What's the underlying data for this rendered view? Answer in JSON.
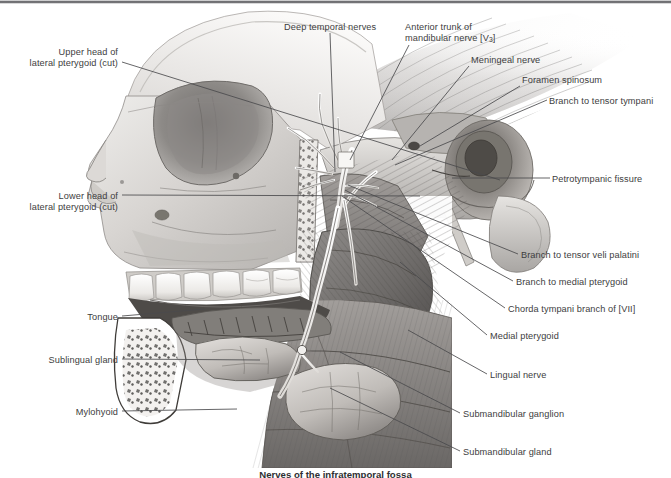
{
  "figure": {
    "title": "Nerves of the infratemporal fossa",
    "caption": "Nerves of the infratemporal fossa",
    "medium": "grayscale anatomical illustration",
    "background_color": "#ffffff",
    "ink_color": "#3d3d40",
    "leader_line_color": "#4a4a4d",
    "tone_light": "#e7e5e4",
    "tone_mid": "#b9b7b6",
    "tone_dark": "#6e6c6c",
    "tone_deep": "#3a3938"
  },
  "labels": [
    {
      "id": "upper-head-lateral-pterygoid",
      "text_line1": "Upper head of",
      "text_line2": "lateral pterygoid (cut)",
      "align": "right",
      "x": 14,
      "y": 47,
      "width": 104
    },
    {
      "id": "lower-head-lateral-pterygoid",
      "text_line1": "Lower head of",
      "text_line2": "lateral pterygoid (cut)",
      "align": "right",
      "x": 14,
      "y": 191,
      "width": 104
    },
    {
      "id": "tongue",
      "text_line1": "Tongue",
      "text_line2": "",
      "align": "right",
      "x": 40,
      "y": 312,
      "width": 78
    },
    {
      "id": "sublingual-gland",
      "text_line1": "Sublingual gland",
      "text_line2": "",
      "align": "right",
      "x": 20,
      "y": 355,
      "width": 98
    },
    {
      "id": "mylohyoid",
      "text_line1": "Mylohyoid",
      "text_line2": "",
      "align": "right",
      "x": 33,
      "y": 407,
      "width": 85
    },
    {
      "id": "deep-temporal-nerves",
      "text_line1": "Deep temporal nerves",
      "text_line2": "",
      "align": "left",
      "x": 284,
      "y": 22,
      "width": 118
    },
    {
      "id": "anterior-trunk-mandibular-nerve",
      "text_line1": "Anterior trunk of",
      "text_line2": "mandibular nerve [V3]",
      "align": "left",
      "x": 405,
      "y": 22,
      "width": 125
    },
    {
      "id": "meningeal-nerve",
      "text_line1": "Meningeal nerve",
      "text_line2": "",
      "align": "left",
      "x": 471,
      "y": 55,
      "width": 96
    },
    {
      "id": "foramen-spinosum",
      "text_line1": "Foramen spinosum",
      "text_line2": "",
      "align": "left",
      "x": 522,
      "y": 75,
      "width": 104
    },
    {
      "id": "branch-to-tensor-tympani",
      "text_line1": "Branch to tensor tympani",
      "text_line2": "",
      "align": "left",
      "x": 549,
      "y": 96,
      "width": 122
    },
    {
      "id": "petrotympanic-fissure",
      "text_line1": "Petrotympanic fissure",
      "text_line2": "",
      "align": "left",
      "x": 552,
      "y": 174,
      "width": 119
    },
    {
      "id": "branch-to-tensor-veli-palatini",
      "text_line1": "Branch to tensor veli palatini",
      "text_line2": "",
      "align": "left",
      "x": 521,
      "y": 250,
      "width": 150
    },
    {
      "id": "branch-to-medial-pterygoid",
      "text_line1": "Branch to medial pterygoid",
      "text_line2": "",
      "align": "left",
      "x": 516,
      "y": 277,
      "width": 155
    },
    {
      "id": "chorda-tympani-branch-of-vii",
      "text_line1": "Chorda tympani branch of [VII]",
      "text_line2": "",
      "align": "left",
      "x": 508,
      "y": 304,
      "width": 163
    },
    {
      "id": "medial-pterygoid",
      "text_line1": "Medial pterygoid",
      "text_line2": "",
      "align": "left",
      "x": 490,
      "y": 331,
      "width": 110
    },
    {
      "id": "lingual-nerve",
      "text_line1": "Lingual nerve",
      "text_line2": "",
      "align": "left",
      "x": 490,
      "y": 370,
      "width": 100
    },
    {
      "id": "submandibular-ganglion",
      "text_line1": "Submandibular ganglion",
      "text_line2": "",
      "align": "left",
      "x": 463,
      "y": 409,
      "width": 134
    },
    {
      "id": "submandibular-gland",
      "text_line1": "Submandibular gland",
      "text_line2": "",
      "align": "left",
      "x": 463,
      "y": 447,
      "width": 122
    }
  ],
  "leader_lines": [
    {
      "id": "leader-upper-head",
      "d": "M122 62 L500 180"
    },
    {
      "id": "leader-lower-head",
      "d": "M122 195 L420 196"
    },
    {
      "id": "leader-tongue",
      "d": "M122 316 L205 309"
    },
    {
      "id": "leader-sublingual",
      "d": "M122 359 L260 360"
    },
    {
      "id": "leader-mylohyoid",
      "d": "M122 411 L237 409"
    },
    {
      "id": "leader-deep-temporal",
      "d": "M330 33 L335 172"
    },
    {
      "id": "leader-anterior-trunk",
      "d": "M409 45 L350 160"
    },
    {
      "id": "leader-meningeal",
      "d": "M469 66 L392 160"
    },
    {
      "id": "leader-foramen-spinosum",
      "d": "M520 86 L420 146"
    },
    {
      "id": "leader-tensor-tympani",
      "d": "M547 100 L395 165"
    },
    {
      "id": "leader-petrotympanic",
      "d": "M550 178 L452 178"
    },
    {
      "id": "leader-tensor-veli-palatini",
      "d": "M518 254 L348 185"
    },
    {
      "id": "leader-medial-pterygoid-branch",
      "d": "M513 281 L345 190"
    },
    {
      "id": "leader-chorda-tympani",
      "d": "M505 308 L342 196"
    },
    {
      "id": "leader-medial-pterygoid",
      "d": "M487 335 L400 262"
    },
    {
      "id": "leader-lingual-nerve",
      "d": "M487 374 L408 330"
    },
    {
      "id": "leader-submandibular-ganglion",
      "d": "M460 413 L340 352"
    },
    {
      "id": "leader-submandibular-gland",
      "d": "M460 451 L330 388"
    }
  ]
}
